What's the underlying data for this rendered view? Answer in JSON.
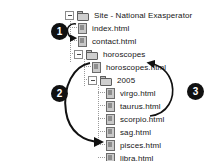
{
  "diagram": {
    "background_color": "#ffffff",
    "badge_color": "#111111",
    "arrow_color": "#111111"
  },
  "tree": {
    "nodes": [
      {
        "id": "site-root",
        "label": "Site - National Exasperator",
        "icon": "folder-icon",
        "type": "folder",
        "expanded": true,
        "depth": 0,
        "twisty": "minus"
      },
      {
        "id": "index-html",
        "label": "index.html",
        "icon": "document-icon",
        "type": "file",
        "depth": 1,
        "twisty": "none"
      },
      {
        "id": "contact-html",
        "label": "contact.html",
        "icon": "document-icon",
        "type": "file",
        "depth": 1,
        "twisty": "none"
      },
      {
        "id": "horoscopes-folder",
        "label": "horoscopes",
        "icon": "folder-icon",
        "type": "folder",
        "expanded": true,
        "depth": 1,
        "twisty": "minus"
      },
      {
        "id": "horoscopes-html",
        "label": "horoscopes.html",
        "icon": "document-icon",
        "type": "file",
        "depth": 2,
        "twisty": "none"
      },
      {
        "id": "year-2005",
        "label": "2005",
        "icon": "folder-icon",
        "type": "folder",
        "expanded": true,
        "depth": 2,
        "twisty": "minus"
      },
      {
        "id": "virgo-html",
        "label": "virgo.html",
        "icon": "document-icon",
        "type": "file",
        "depth": 3,
        "twisty": "none"
      },
      {
        "id": "taurus-html",
        "label": "taurus.html",
        "icon": "document-icon",
        "type": "file",
        "depth": 3,
        "twisty": "none"
      },
      {
        "id": "scorpio-html",
        "label": "scorpio.html",
        "icon": "document-icon",
        "type": "file",
        "depth": 3,
        "twisty": "none"
      },
      {
        "id": "sag-html",
        "label": "sag.html",
        "icon": "document-icon",
        "type": "file",
        "depth": 3,
        "twisty": "none"
      },
      {
        "id": "pisces-html",
        "label": "pisces.html",
        "icon": "document-icon",
        "type": "file",
        "depth": 3,
        "twisty": "none"
      },
      {
        "id": "libra-html",
        "label": "libra.html",
        "icon": "document-icon",
        "type": "file",
        "depth": 3,
        "twisty": "none"
      }
    ]
  },
  "annotations": [
    {
      "id": "callout-1",
      "number": "1",
      "describes": "arrow from index.html to contact.html"
    },
    {
      "id": "callout-2",
      "number": "2",
      "describes": "arrow from horoscopes.html down to pisces.html"
    },
    {
      "id": "callout-3",
      "number": "3",
      "describes": "arrow from scorpio.html up to horoscopes.html"
    }
  ]
}
